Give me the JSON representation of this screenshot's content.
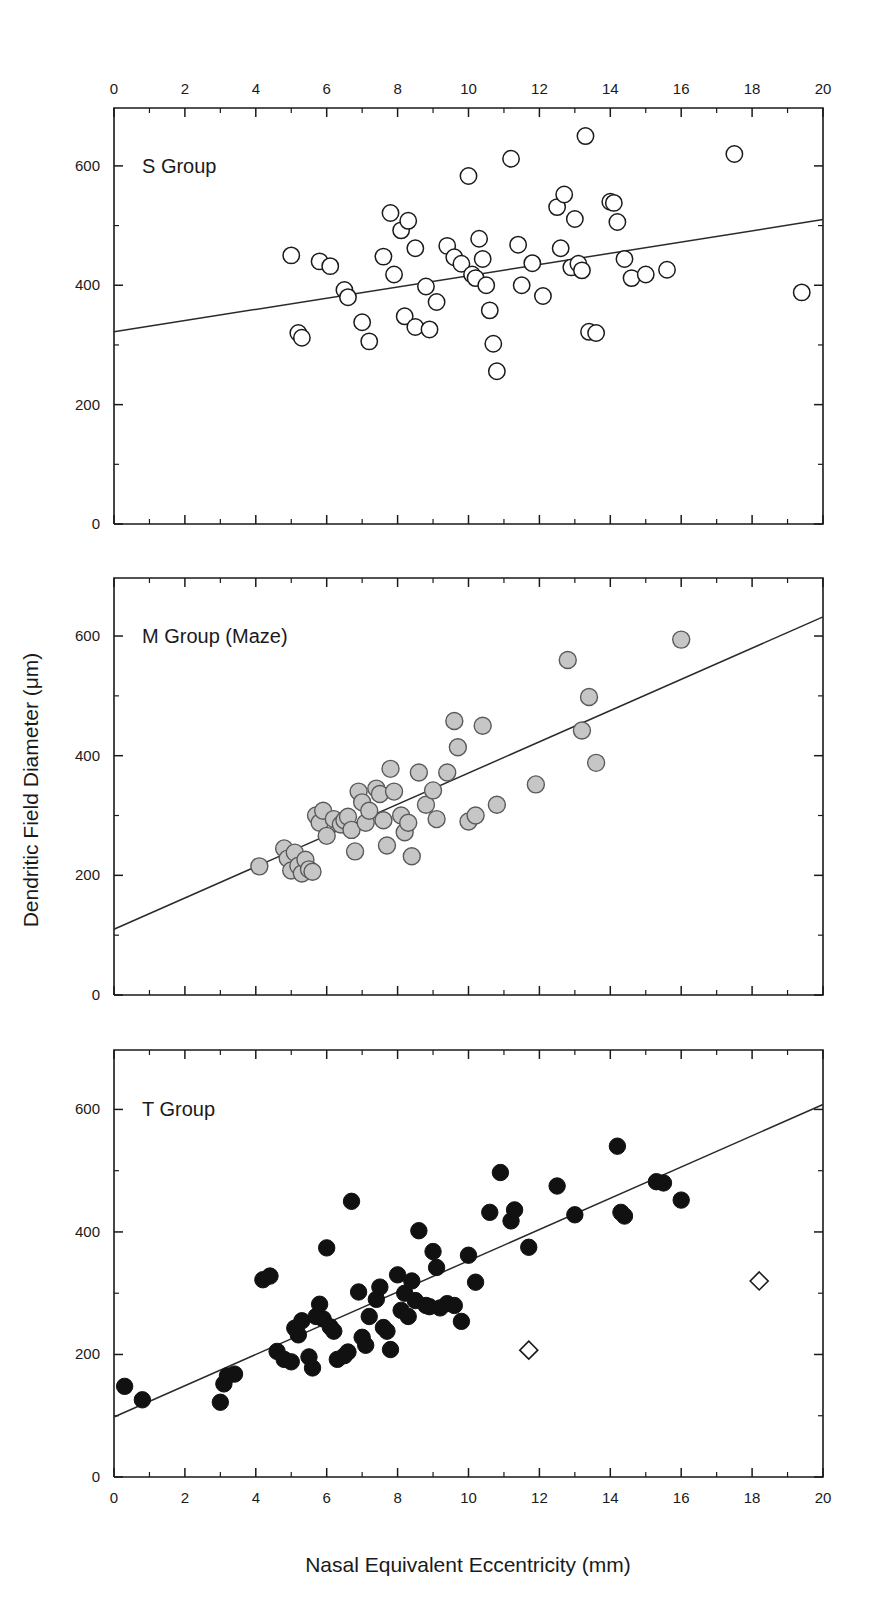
{
  "figure": {
    "axis_titles": {
      "x": "Nasal Equivalent Eccentricity (mm)",
      "y": "Dendritic Field Diameter (μm)"
    },
    "x_tick_labels": [
      "0",
      "2",
      "4",
      "6",
      "8",
      "10",
      "12",
      "14",
      "16",
      "18",
      "20"
    ],
    "y_tick_labels": [
      "0",
      "200",
      "400",
      "600"
    ],
    "colors": {
      "axis": "#1a1a1a",
      "open_marker_fill": "#ffffff",
      "gray_marker_fill": "#c6c6c6",
      "gray_marker_stroke": "#5a5a5a",
      "solid_marker_fill": "#111111",
      "fitline": "#2a2a2a"
    }
  },
  "chart_data": [
    {
      "type": "scatter",
      "panel": "top",
      "title": "S Group",
      "xlabel": "Nasal Equivalent Eccentricity (mm)",
      "ylabel": "Dendritic Field Diameter (μm)",
      "xlim": [
        0,
        20
      ],
      "ylim": [
        0,
        680
      ],
      "x_ticks": [
        0,
        2,
        4,
        6,
        8,
        10,
        12,
        14,
        16,
        18,
        20
      ],
      "x_minor_tick_step": 1,
      "y_ticks": [
        0,
        200,
        400,
        600
      ],
      "y_minor_tick_step": 100,
      "grid": false,
      "legend": "none",
      "marker": "open-circle",
      "series": [
        {
          "name": "S Group",
          "marker": "open-circle",
          "points": [
            [
              5.0,
              450
            ],
            [
              5.2,
              320
            ],
            [
              5.3,
              312
            ],
            [
              5.8,
              440
            ],
            [
              6.1,
              432
            ],
            [
              6.5,
              392
            ],
            [
              6.6,
              380
            ],
            [
              7.0,
              338
            ],
            [
              7.2,
              306
            ],
            [
              7.6,
              448
            ],
            [
              7.8,
              521
            ],
            [
              7.9,
              418
            ],
            [
              8.1,
              492
            ],
            [
              8.2,
              348
            ],
            [
              8.3,
              508
            ],
            [
              8.5,
              462
            ],
            [
              8.5,
              330
            ],
            [
              8.8,
              398
            ],
            [
              8.9,
              326
            ],
            [
              9.1,
              372
            ],
            [
              9.4,
              466
            ],
            [
              9.6,
              447
            ],
            [
              9.8,
              436
            ],
            [
              10.0,
              583
            ],
            [
              10.1,
              418
            ],
            [
              10.2,
              412
            ],
            [
              10.3,
              478
            ],
            [
              10.4,
              444
            ],
            [
              10.5,
              400
            ],
            [
              10.6,
              358
            ],
            [
              10.7,
              302
            ],
            [
              10.8,
              256
            ],
            [
              11.2,
              612
            ],
            [
              11.4,
              468
            ],
            [
              11.5,
              400
            ],
            [
              11.8,
              437
            ],
            [
              12.1,
              382
            ],
            [
              12.5,
              531
            ],
            [
              12.6,
              462
            ],
            [
              12.7,
              552
            ],
            [
              12.9,
              430
            ],
            [
              13.0,
              511
            ],
            [
              13.1,
              436
            ],
            [
              13.2,
              425
            ],
            [
              13.3,
              650
            ],
            [
              13.4,
              322
            ],
            [
              13.6,
              320
            ],
            [
              14.0,
              540
            ],
            [
              14.1,
              538
            ],
            [
              14.2,
              506
            ],
            [
              14.4,
              444
            ],
            [
              14.6,
              412
            ],
            [
              15.0,
              418
            ],
            [
              15.6,
              426
            ],
            [
              17.5,
              620
            ],
            [
              19.4,
              388
            ]
          ]
        }
      ],
      "fit_line": {
        "x": [
          0,
          20
        ],
        "y": [
          322,
          510
        ]
      }
    },
    {
      "type": "scatter",
      "panel": "middle",
      "title": "M Group (Maze)",
      "xlabel": "Nasal Equivalent Eccentricity (mm)",
      "ylabel": "Dendritic Field Diameter (μm)",
      "xlim": [
        0,
        20
      ],
      "ylim": [
        0,
        680
      ],
      "x_ticks": [
        0,
        2,
        4,
        6,
        8,
        10,
        12,
        14,
        16,
        18,
        20
      ],
      "x_minor_tick_step": 1,
      "y_ticks": [
        0,
        200,
        400,
        600
      ],
      "y_minor_tick_step": 100,
      "grid": false,
      "legend": "none",
      "marker": "gray-circle",
      "series": [
        {
          "name": "M Group (Maze)",
          "marker": "gray-circle",
          "points": [
            [
              4.1,
              215
            ],
            [
              4.8,
              245
            ],
            [
              4.9,
              228
            ],
            [
              5.0,
              208
            ],
            [
              5.1,
              238
            ],
            [
              5.2,
              216
            ],
            [
              5.3,
              203
            ],
            [
              5.4,
              226
            ],
            [
              5.5,
              210
            ],
            [
              5.6,
              206
            ],
            [
              5.7,
              300
            ],
            [
              5.8,
              288
            ],
            [
              5.9,
              308
            ],
            [
              6.0,
              266
            ],
            [
              6.2,
              294
            ],
            [
              6.4,
              285
            ],
            [
              6.5,
              292
            ],
            [
              6.6,
              298
            ],
            [
              6.7,
              276
            ],
            [
              6.8,
              240
            ],
            [
              6.9,
              340
            ],
            [
              7.0,
              322
            ],
            [
              7.1,
              288
            ],
            [
              7.2,
              308
            ],
            [
              7.4,
              345
            ],
            [
              7.5,
              336
            ],
            [
              7.6,
              292
            ],
            [
              7.7,
              250
            ],
            [
              7.8,
              378
            ],
            [
              7.9,
              340
            ],
            [
              8.1,
              300
            ],
            [
              8.2,
              272
            ],
            [
              8.3,
              288
            ],
            [
              8.4,
              232
            ],
            [
              8.6,
              372
            ],
            [
              8.8,
              318
            ],
            [
              9.0,
              342
            ],
            [
              9.1,
              294
            ],
            [
              9.4,
              372
            ],
            [
              9.6,
              458
            ],
            [
              9.7,
              414
            ],
            [
              10.0,
              290
            ],
            [
              10.2,
              300
            ],
            [
              10.4,
              450
            ],
            [
              10.8,
              318
            ],
            [
              11.9,
              352
            ],
            [
              12.8,
              560
            ],
            [
              13.2,
              442
            ],
            [
              13.4,
              498
            ],
            [
              13.6,
              388
            ],
            [
              16.0,
              594
            ]
          ]
        }
      ],
      "fit_line": {
        "x": [
          0,
          20
        ],
        "y": [
          110,
          632
        ]
      }
    },
    {
      "type": "scatter",
      "panel": "bottom",
      "title": "T Group",
      "xlabel": "Nasal Equivalent Eccentricity (mm)",
      "ylabel": "Dendritic Field Diameter (μm)",
      "xlim": [
        0,
        20
      ],
      "ylim": [
        0,
        680
      ],
      "x_ticks": [
        0,
        2,
        4,
        6,
        8,
        10,
        12,
        14,
        16,
        18,
        20
      ],
      "x_minor_tick_step": 1,
      "y_ticks": [
        0,
        200,
        400,
        600
      ],
      "y_minor_tick_step": 100,
      "grid": false,
      "legend": "none",
      "marker": "solid-circle",
      "series": [
        {
          "name": "T Group",
          "marker": "solid-circle",
          "points": [
            [
              0.3,
              148
            ],
            [
              0.8,
              126
            ],
            [
              3.0,
              122
            ],
            [
              3.1,
              152
            ],
            [
              3.2,
              165
            ],
            [
              3.4,
              168
            ],
            [
              4.2,
              322
            ],
            [
              4.4,
              328
            ],
            [
              4.6,
              205
            ],
            [
              4.8,
              192
            ],
            [
              5.0,
              188
            ],
            [
              5.1,
              243
            ],
            [
              5.2,
              232
            ],
            [
              5.3,
              255
            ],
            [
              5.5,
              196
            ],
            [
              5.6,
              178
            ],
            [
              5.7,
              262
            ],
            [
              5.8,
              282
            ],
            [
              5.9,
              258
            ],
            [
              6.0,
              374
            ],
            [
              6.1,
              245
            ],
            [
              6.2,
              238
            ],
            [
              6.3,
              192
            ],
            [
              6.5,
              198
            ],
            [
              6.6,
              204
            ],
            [
              6.7,
              450
            ],
            [
              6.9,
              302
            ],
            [
              7.0,
              228
            ],
            [
              7.1,
              215
            ],
            [
              7.2,
              262
            ],
            [
              7.4,
              290
            ],
            [
              7.5,
              310
            ],
            [
              7.6,
              244
            ],
            [
              7.7,
              238
            ],
            [
              7.8,
              208
            ],
            [
              8.0,
              330
            ],
            [
              8.1,
              272
            ],
            [
              8.2,
              300
            ],
            [
              8.3,
              262
            ],
            [
              8.4,
              320
            ],
            [
              8.5,
              288
            ],
            [
              8.6,
              402
            ],
            [
              8.8,
              280
            ],
            [
              8.9,
              278
            ],
            [
              9.0,
              368
            ],
            [
              9.1,
              342
            ],
            [
              9.2,
              276
            ],
            [
              9.4,
              283
            ],
            [
              9.6,
              280
            ],
            [
              9.8,
              254
            ],
            [
              10.0,
              362
            ],
            [
              10.2,
              318
            ],
            [
              10.6,
              432
            ],
            [
              10.9,
              497
            ],
            [
              11.2,
              418
            ],
            [
              11.3,
              436
            ],
            [
              11.7,
              375
            ],
            [
              12.5,
              475
            ],
            [
              13.0,
              428
            ],
            [
              14.2,
              540
            ],
            [
              14.3,
              432
            ],
            [
              14.4,
              426
            ],
            [
              15.3,
              482
            ],
            [
              15.5,
              480
            ],
            [
              16.0,
              452
            ]
          ]
        },
        {
          "name": "outliers",
          "marker": "open-diamond",
          "points": [
            [
              11.7,
              207
            ],
            [
              18.2,
              320
            ]
          ]
        }
      ],
      "fit_line": {
        "x": [
          0,
          20
        ],
        "y": [
          98,
          608
        ]
      }
    }
  ]
}
